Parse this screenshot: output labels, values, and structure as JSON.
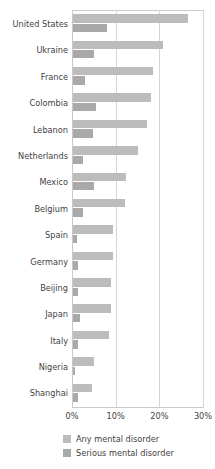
{
  "chart_data": {
    "type": "bar",
    "orientation": "horizontal",
    "title": "",
    "subtitle": "",
    "xlabel": "",
    "ylabel": "",
    "xlim": [
      0,
      30
    ],
    "x_unit": "%",
    "grid": true,
    "gridlines_at": [
      10,
      20,
      30
    ],
    "legend_position": "bottom",
    "categories": [
      "United States",
      "Ukraine",
      "France",
      "Colombia",
      "Lebanon",
      "Netherlands",
      "Mexico",
      "Belgium",
      "Spain",
      "Germany",
      "Beijing",
      "Japan",
      "Italy",
      "Nigeria",
      "Shanghai"
    ],
    "tick_labels": [
      "0%",
      "10%",
      "20%",
      "30%"
    ],
    "tick_values": [
      0,
      10,
      20,
      30
    ],
    "series": [
      {
        "name": "Any mental disorder",
        "color": "#bcbcbc",
        "values": [
          26.4,
          20.5,
          18.4,
          17.8,
          16.9,
          14.9,
          12.2,
          12.0,
          9.2,
          9.1,
          8.8,
          8.8,
          8.2,
          4.7,
          4.3
        ]
      },
      {
        "name": "Serious mental disorder",
        "color": "#a9a9a9",
        "values": [
          7.7,
          4.8,
          2.7,
          5.2,
          4.6,
          2.3,
          4.8,
          2.4,
          1.0,
          1.2,
          1.1,
          1.5,
          1.2,
          0.4,
          1.1
        ]
      }
    ]
  },
  "legend": {
    "items": [
      {
        "label": "Any mental disorder",
        "swatch": "any"
      },
      {
        "label": "Serious mental disorder",
        "swatch": "serious"
      }
    ]
  }
}
